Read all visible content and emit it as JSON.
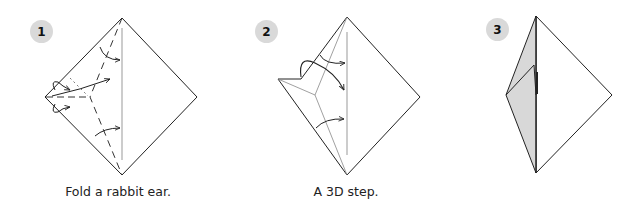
{
  "diagram": {
    "steps": [
      {
        "number": "1",
        "caption": "Fold a rabbit ear.",
        "icon": "step-number-badge",
        "badge_color": "#d9d9d9"
      },
      {
        "number": "2",
        "caption": "A 3D step.",
        "icon": "step-number-badge",
        "badge_color": "#d9d9d9"
      },
      {
        "number": "3",
        "caption": "",
        "icon": "step-number-badge",
        "badge_color": "#d9d9d9"
      }
    ],
    "colors": {
      "line": "#222222",
      "crease": "#999999",
      "shade": "#d8d8d8",
      "background": "#ffffff"
    }
  }
}
